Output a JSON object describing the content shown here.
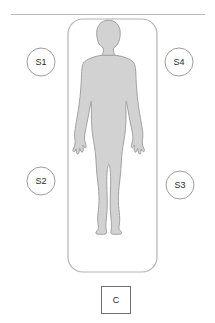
{
  "diagram": {
    "title": "",
    "colors": {
      "background": "#ffffff",
      "body_fill": "#d2d2d2",
      "body_stroke": "#9a9a9a",
      "bed_stroke": "#b4b4b4",
      "wall_line": "#b9b9b9",
      "node_stroke": "#9e9e9e",
      "node_fill": "#ffffff",
      "text": "#2a2a2a",
      "controller_stroke": "#6e6e6e"
    },
    "wall_line": {
      "name": "wall-line",
      "x1": 11,
      "y1": 14.5,
      "x2": 205,
      "y2": 14.5
    },
    "bed": {
      "name": "bed-outline",
      "x": 68,
      "y": 19,
      "width": 89,
      "height": 253,
      "radius": 15
    },
    "body": {
      "name": "human-body-silhouette"
    },
    "sensors": [
      {
        "id": "S1",
        "label": "S1",
        "cx": 41,
        "cy": 62,
        "r": 14
      },
      {
        "id": "S4",
        "label": "S4",
        "cx": 179,
        "cy": 62,
        "r": 14
      },
      {
        "id": "S2",
        "label": "S2",
        "cx": 41,
        "cy": 181,
        "r": 14
      },
      {
        "id": "S3",
        "label": "S3",
        "cx": 180,
        "cy": 185,
        "r": 14
      }
    ],
    "controller": {
      "id": "C",
      "label": "C",
      "x": 101,
      "y": 286,
      "width": 29,
      "height": 27
    }
  }
}
